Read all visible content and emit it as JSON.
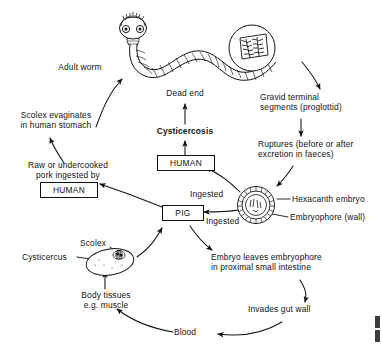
{
  "diagram": {
    "type": "cycle-flow-diagram",
    "stroke_color": "#111111",
    "background_color": "#ffffff"
  },
  "labels": {
    "adult_worm": "Adult worm",
    "scolex_evaginates": "Scolex evaginates\nin human stomach",
    "raw_pork": "Raw or undercooked\npork ingested by",
    "dead_end": "Dead end",
    "cysticercosis": "Cysticercosis",
    "gravid_segments": "Gravid terminal\nsegments (proglottid)",
    "ruptures": "Ruptures (before or after\nexcretion in faeces)",
    "hexacanth_embryo": "Hexacanth embryo",
    "embryophore": "Embryophore (wall)",
    "ingested_upper": "Ingested",
    "ingested_lower": "Ingested",
    "embryo_leaves": "Embryo leaves embryophore\nin proximal small intestine",
    "invades_gut_wall": "Invades gut wall",
    "blood": "Blood",
    "body_tissues": "Body tissues\ne.g. muscle",
    "scolex": "Scolex",
    "cysticercus": "Cysticercus"
  },
  "boxes": {
    "human_upper": "HUMAN",
    "human_lower": "HUMAN",
    "pig": "PIG"
  },
  "illustrations": {
    "adult_worm_figure": "segmented-tapeworm-with-scolex",
    "proglottid_inset": "magnified-gravid-proglottid-circle",
    "egg_figure": "taenia-egg-radially-striated-embryophore",
    "cysticercus_figure": "cysticercus-bladder-with-invaginated-scolex"
  },
  "flow_edges": [
    {
      "from": "scolex_evaginates",
      "to": "adult_worm",
      "style": "curved-arrow"
    },
    {
      "from": "raw_pork_human",
      "to": "scolex_evaginates",
      "style": "curved-arrow"
    },
    {
      "from": "adult_worm",
      "to": "gravid_segments",
      "style": "curved-arrow"
    },
    {
      "from": "gravid_segments",
      "to": "ruptures",
      "style": "straight-arrow"
    },
    {
      "from": "ruptures",
      "to": "egg",
      "style": "curved-arrow"
    },
    {
      "from": "egg",
      "to": "human_upper",
      "label": "Ingested",
      "style": "curved-arrow"
    },
    {
      "from": "egg",
      "to": "pig",
      "label": "Ingested",
      "style": "curved-arrow"
    },
    {
      "from": "human_upper",
      "to": "cysticercosis",
      "style": "straight-arrow"
    },
    {
      "from": "cysticercosis",
      "to": "dead_end",
      "style": "straight-arrow"
    },
    {
      "from": "pig",
      "to": "embryo_leaves",
      "style": "curved-arrow"
    },
    {
      "from": "embryo_leaves",
      "to": "invades_gut_wall",
      "style": "curved-arrow"
    },
    {
      "from": "invades_gut_wall",
      "to": "blood",
      "style": "curved-arrow"
    },
    {
      "from": "blood",
      "to": "body_tissues",
      "style": "curved-arrow"
    },
    {
      "from": "body_tissues",
      "to": "cysticercus",
      "style": "straight-arrow"
    },
    {
      "from": "cysticercus",
      "to": "pig",
      "style": "curved-arrow"
    },
    {
      "from": "pig",
      "to": "raw_pork_human",
      "style": "curved-arrow"
    }
  ]
}
